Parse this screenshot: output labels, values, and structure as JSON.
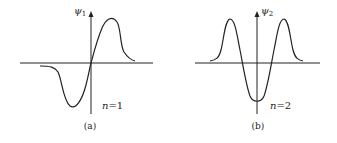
{
  "panels": [
    {
      "id": "a",
      "caption": "(a)",
      "y_label": "ψ",
      "y_label_sub": "1",
      "annotation_n": "n",
      "annotation_eq": "=1"
    },
    {
      "id": "b",
      "caption": "(b)",
      "y_label": "ψ",
      "y_label_sub": "2",
      "annotation_n": "n",
      "annotation_eq": "=2"
    }
  ],
  "colors": {
    "stroke": "#222222",
    "background": "#ffffff"
  }
}
